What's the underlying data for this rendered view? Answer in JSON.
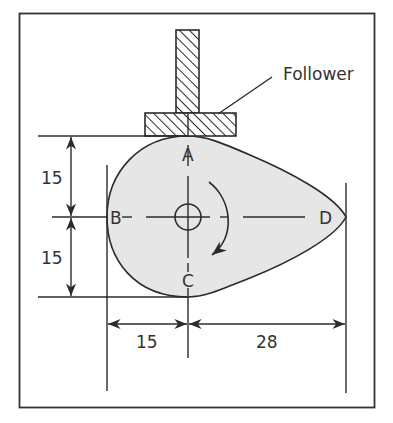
{
  "diagram": {
    "colors": {
      "background": "#ffffff",
      "line": "#2b2b2b",
      "cam_fill": "#e6e6e6",
      "text": "#333333"
    },
    "labels": {
      "follower": "Follower",
      "point_a": "A",
      "point_b": "B",
      "point_c": "C",
      "point_d": "D"
    },
    "dimensions": {
      "upper_vertical": "15",
      "lower_vertical": "15",
      "left_horizontal": "15",
      "right_horizontal": "28"
    },
    "components": [
      "frame-border",
      "follower-stem",
      "follower-plate",
      "cam-profile",
      "camshaft-hole",
      "rotation-arrow",
      "center-lines",
      "dimension-lines"
    ]
  }
}
